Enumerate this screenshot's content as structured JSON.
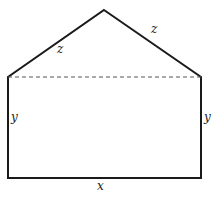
{
  "diagram": {
    "type": "pentagon-house-shape",
    "stroke_color": "#1a1a1a",
    "dashed_color": "#555555",
    "vertices": {
      "apex": [
        104,
        10
      ],
      "left_shoulder": [
        8,
        77
      ],
      "right_shoulder": [
        201,
        77
      ],
      "bottom_left": [
        8,
        178
      ],
      "bottom_right": [
        201,
        178
      ]
    },
    "labels": {
      "roof_left": "z",
      "roof_right": "z",
      "wall_left": "y",
      "wall_right": "y",
      "base": "x"
    }
  }
}
